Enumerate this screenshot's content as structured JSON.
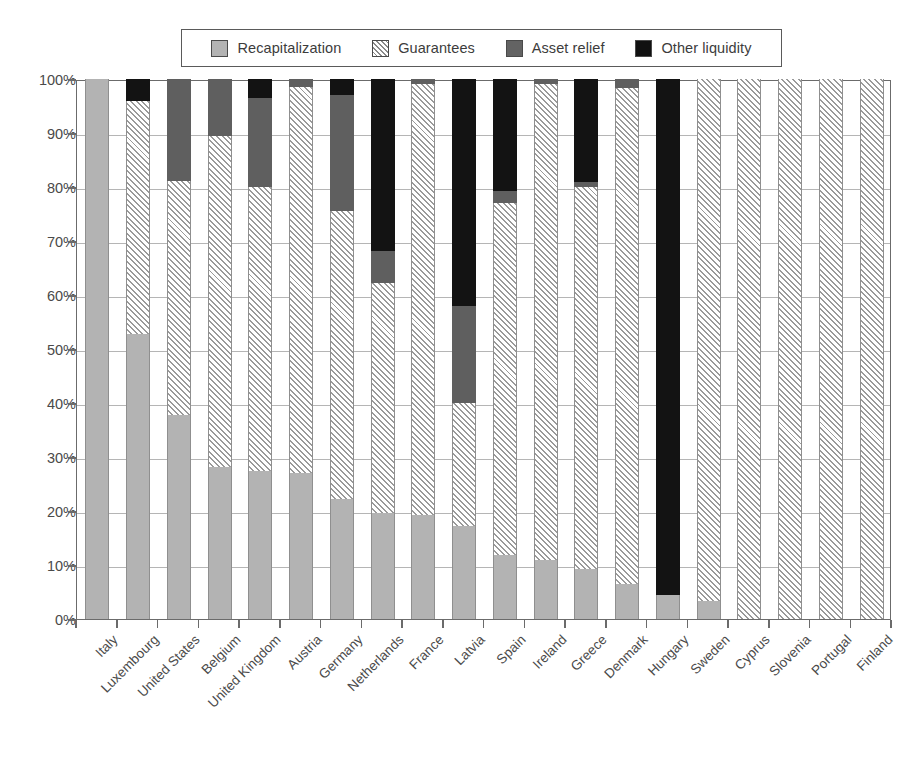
{
  "legend": {
    "items": [
      {
        "label": "Recapitalization",
        "key": "recap",
        "color": "#b3b3b3",
        "swatch": "recap-swatch"
      },
      {
        "label": "Guarantees",
        "key": "guarantees",
        "color": "#ffffff",
        "swatch": "guarantees-swatch"
      },
      {
        "label": "Asset relief",
        "key": "asset",
        "color": "#5f5f5f",
        "swatch": "asset-relief-swatch"
      },
      {
        "label": "Other liquidity",
        "key": "other",
        "color": "#131313",
        "swatch": "other-liquidity-swatch"
      }
    ]
  },
  "chart_data": {
    "type": "bar",
    "subtype": "stacked-bar-100-percent",
    "title": "",
    "xlabel": "",
    "ylabel": "",
    "ylim": [
      0,
      100
    ],
    "grid": true,
    "legend_position": "top",
    "y_ticks": [
      "0%",
      "10%",
      "20%",
      "30%",
      "40%",
      "50%",
      "60%",
      "70%",
      "80%",
      "90%",
      "100%"
    ],
    "y_tick_values": [
      0,
      10,
      20,
      30,
      40,
      50,
      60,
      70,
      80,
      90,
      100
    ],
    "categories": [
      "Italy",
      "Luxembourg",
      "United States",
      "Belgium",
      "United Kingdom",
      "Austria",
      "Germany",
      "Netherlands",
      "France",
      "Latvia",
      "Spain",
      "Ireland",
      "Greece",
      "Denmark",
      "Hungary",
      "Sweden",
      "Cyprus",
      "Slovenia",
      "Portugal",
      "Finland"
    ],
    "series": [
      {
        "name": "Recapitalization",
        "key": "recap",
        "values": [
          100,
          52.8,
          37.8,
          28.2,
          27.4,
          27.0,
          22.3,
          19.6,
          19.3,
          17.2,
          11.9,
          11.0,
          9.3,
          6.4,
          4.4,
          3.4,
          0,
          0,
          0,
          0
        ]
      },
      {
        "name": "Guarantees",
        "key": "guarantees",
        "values": [
          0,
          43.2,
          43.4,
          61.3,
          52.6,
          71.5,
          53.3,
          42.7,
          79.7,
          22.8,
          65.2,
          88.0,
          70.7,
          91.9,
          0,
          96.6,
          100,
          100,
          100,
          100
        ]
      },
      {
        "name": "Asset relief",
        "key": "asset",
        "values": [
          0,
          0,
          18.8,
          10.5,
          16.5,
          1.5,
          21.4,
          5.9,
          1.0,
          18.0,
          2.1,
          1.0,
          1.0,
          1.7,
          0,
          0,
          0,
          0,
          0,
          0
        ]
      },
      {
        "name": "Other liquidity",
        "key": "other",
        "values": [
          0,
          4.0,
          0,
          0,
          3.5,
          0,
          3.0,
          31.8,
          0,
          42.0,
          20.8,
          0,
          19.0,
          0,
          95.6,
          0,
          0,
          0,
          0,
          0
        ]
      }
    ]
  }
}
